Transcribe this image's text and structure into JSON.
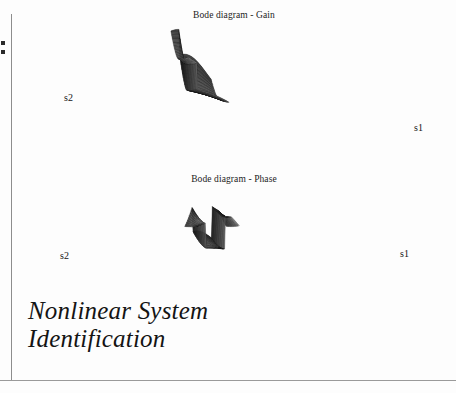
{
  "page": {
    "background_color": "#fdfdfd",
    "ink_color": "#141414",
    "rule_color": "#8d8d8d"
  },
  "document_title": {
    "line1": "Nonlinear System",
    "line2": "Identification"
  },
  "charts": [
    {
      "id": "gain",
      "title": "Bode diagram - Gain",
      "axis_left_label": "s2",
      "axis_right_label": "s1"
    },
    {
      "id": "phase",
      "title": "Bode diagram - Phase",
      "axis_left_label": "s2",
      "axis_right_label": "s1"
    }
  ],
  "chart_data": [
    {
      "type": "line",
      "render": "3d-mesh-surface",
      "title": "Bode diagram - Gain",
      "xlabel": "s1",
      "ylabel": "s2",
      "zlabel": "Gain",
      "grid": false,
      "legend": null,
      "annotations": [
        "s1",
        "s2"
      ],
      "description": "Wireframe mesh surface of a two-input Bode gain map; a dark shaded ridge runs along the far edge, a sharp step drops down to a broad lightly-hatched plateau that slopes toward the s1 corner.",
      "mesh": {
        "n_u": 42,
        "n_v": 26,
        "projection": {
          "origin_x": 188,
          "origin_y": 92,
          "u_axis": [
            6.1,
            1.05
          ],
          "v_axis": [
            -4.45,
            1.55
          ],
          "z_scale": -1.0
        },
        "z_surface_note": "z(u,v) = plateau(v) + ridge bump near v_max, with a step discontinuity at u=9",
        "ridge_height": 34,
        "plateau_height": 2,
        "step_u_index": 9,
        "step_drop": 30
      }
    },
    {
      "type": "line",
      "render": "3d-mesh-surface",
      "title": "Bode diagram - Phase",
      "xlabel": "s1",
      "ylabel": "s2",
      "zlabel": "Phase",
      "grid": false,
      "legend": null,
      "annotations": [
        "s1",
        "s2"
      ],
      "description": "Wireframe mesh surface of the phase map; a dark shaded central band with two tall vertical fringe walls marking phase wrap discontinuities, tapering to sharp points at both s1 and s2 extremes.",
      "mesh": {
        "n_u": 46,
        "n_v": 22,
        "projection": {
          "origin_x": 200,
          "origin_y": 58,
          "u_axis": [
            5.7,
            0.22
          ],
          "v_axis": [
            -3.9,
            1.35
          ],
          "z_scale": -1.0
        },
        "z_surface_note": "z(u,v) has two wrap discontinuities producing near-vertical fringe walls at u≈9 and u≈30",
        "wrap_u_indices": [
          9,
          30
        ],
        "wrap_drop": 40,
        "ridge_height": 16
      }
    }
  ]
}
